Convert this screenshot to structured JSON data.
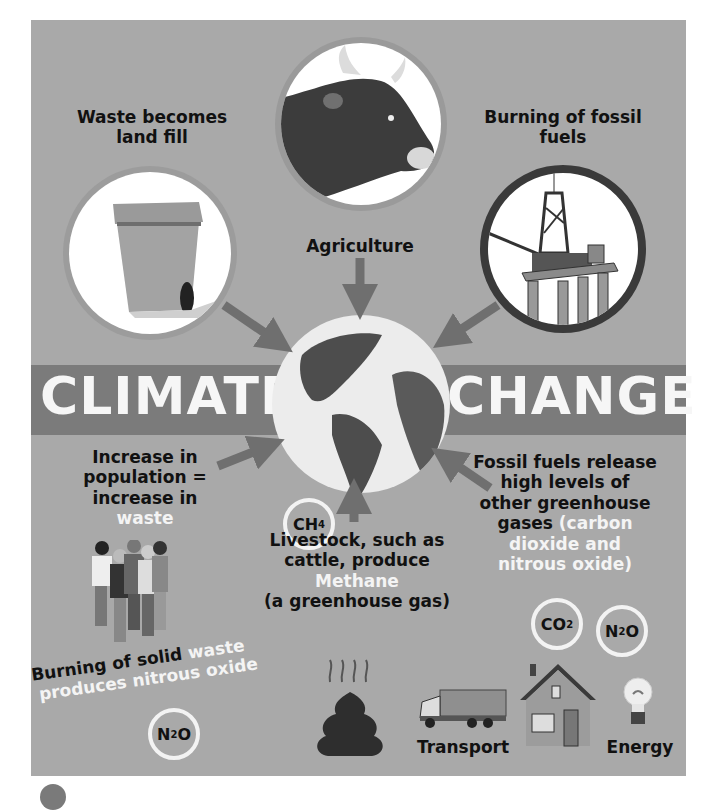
{
  "title": {
    "left": "CLIMATE",
    "right": "CHANGE"
  },
  "sources": {
    "waste": {
      "label_line1": "Waste becomes",
      "label_line2": "land fill",
      "icon": "wheelie-bin"
    },
    "agriculture": {
      "label": "Agriculture",
      "icon": "cow-head"
    },
    "fossil": {
      "label_line1": "Burning of fossil",
      "label_line2": "fuels",
      "icon": "oil-rig"
    }
  },
  "effects": {
    "population": {
      "lines": [
        "Increase in",
        "population =",
        "increase in"
      ],
      "highlight": "waste"
    },
    "livestock": {
      "lines": [
        "Livestock, such as",
        "cattle, produce"
      ],
      "highlight": "Methane",
      "tail": "(a greenhouse gas)",
      "gas": "CH4"
    },
    "fossil_release": {
      "lines": [
        "Fossil fuels release",
        "high levels of",
        "other greenhouse"
      ],
      "prefix": "gases",
      "highlight_lines": [
        "(carbon",
        "dioxide and",
        "nitrous oxide)"
      ]
    },
    "solid_waste": {
      "dark": "Burning of solid",
      "highlight1": "waste",
      "highlight2": "produces nitrous oxide",
      "gas": "N2O"
    }
  },
  "gases": {
    "ch4": {
      "base": "CH",
      "sub": "4"
    },
    "co2": {
      "base": "CO",
      "sub": "2"
    },
    "n2o_right": {
      "base": "N",
      "sub": "2",
      "tail": "O"
    },
    "n2o_left": {
      "base": "N",
      "sub": "2",
      "tail": "O"
    }
  },
  "sectors": {
    "transport": "Transport",
    "energy": "Energy"
  },
  "colors": {
    "panel": "#a9a9a9",
    "band": "#7b7b7b",
    "arrow": "#6f6f6f",
    "text": "#111111",
    "highlight": "#f4f4f4"
  }
}
